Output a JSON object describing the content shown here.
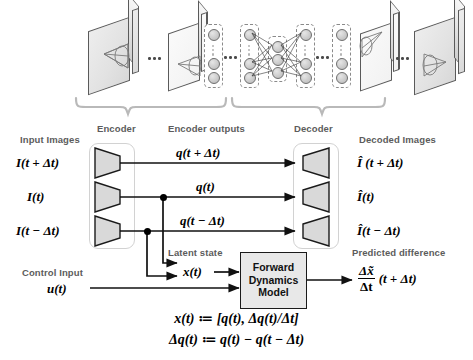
{
  "figure": {
    "top_labels": {
      "encoder": "Encoder",
      "encoder_outputs": "Encoder outputs",
      "decoder": "Decoder"
    },
    "column_headers": {
      "input_images": "Input Images",
      "decoded_images": "Decoded Images",
      "latent_state": "Latent state",
      "control_input": "Control Input",
      "predicted_difference": "Predicted difference"
    },
    "inputs": [
      "I(t + Δt)",
      "I(t)",
      "I(t − Δt)"
    ],
    "encoder_outputs": [
      "q(t + Δt)",
      "q(t)",
      "q(t − Δt)"
    ],
    "outputs": [
      "Î (t + Δt)",
      "Î(t)",
      "Î(t − Δt)"
    ],
    "latent_state_symbol": "x(t)",
    "control_input_symbol": "u(t)",
    "model_box": {
      "line1": "Forward",
      "line2": "Dynamics",
      "line3": "Model"
    },
    "predicted_difference_symbol": {
      "numerator": "Δx̃",
      "denominator": "Δt",
      "argument": "(t + Δt)"
    },
    "equations": [
      "x(t) ≔ [q(t), Δq(t)/Δt]",
      "Δq(t) ≔ q(t) − q(t − Δt)"
    ],
    "ellipsis": "•••",
    "colors": {
      "ink": "#111111",
      "label_gray": "#5c5c5c",
      "slab_fill": "#e4e4e4",
      "slab_stroke": "#5a5a5a",
      "node_fill": "#cfcfcf",
      "box_fill": "#e8e8e8",
      "dashed_stroke": "#8a8a8a",
      "soft_border": "#d2d2d2"
    }
  }
}
